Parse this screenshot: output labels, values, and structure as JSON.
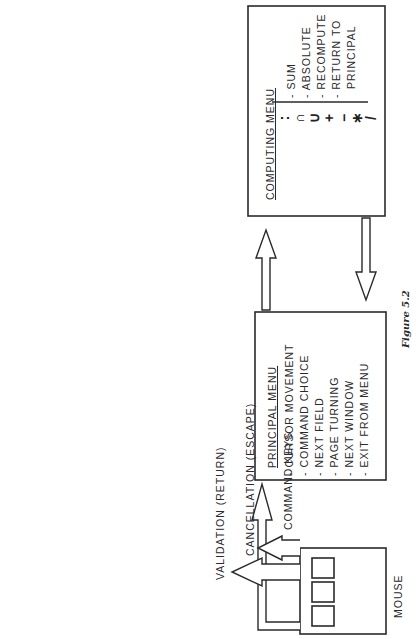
{
  "figure": {
    "caption": "Figure 5.2"
  },
  "computing_menu": {
    "title": "COMPUTING MENU",
    "items": [
      {
        "symbol": ":",
        "label": "SUM"
      },
      {
        "symbol": "∩",
        "label": "ABSOLUTE"
      },
      {
        "symbol": "∪",
        "label": ""
      },
      {
        "symbol": "+",
        "label": ""
      },
      {
        "symbol": "−",
        "label": "RECOMPUTE"
      },
      {
        "symbol": "*",
        "label": "RETURN TO PRINCIPAL"
      },
      {
        "symbol": "/",
        "label": ""
      }
    ],
    "labels": [
      "- SUM",
      "- ABSOLUTE",
      "- RECOMPUTE",
      "- RETURN TO",
      "  PRINCIPAL"
    ],
    "symbols": [
      ":",
      "∩",
      "∪",
      "+",
      "−",
      "∗",
      "/"
    ]
  },
  "principal_menu": {
    "title": "PRINCIPAL MENU",
    "items": [
      "- CURSOR MOVEMENT",
      "- COMMAND CHOICE",
      "- NEXT FIELD",
      "- PAGE TURNING",
      "- NEXT WINDOW",
      "- EXIT FROM MENU"
    ]
  },
  "mouse": {
    "label": "MOUSE",
    "button_count": 3,
    "functions": [
      "VALIDATION (RETURN)",
      "CANCELLATION (ESCAPE)",
      "COMMAND KEYS"
    ]
  },
  "connections": [
    {
      "from": "principal_menu",
      "to": "computing_menu",
      "type": "hollow-arrow"
    },
    {
      "from": "computing_menu",
      "to": "principal_menu",
      "type": "hollow-arrow"
    },
    {
      "from": "mouse",
      "to": "principal_menu",
      "type": "hollow-arrow"
    },
    {
      "from": "mouse",
      "to": "validation",
      "type": "hollow-arrow"
    },
    {
      "from": "mouse",
      "to": "cancellation",
      "type": "hollow-arrow"
    }
  ],
  "colors": {
    "line": "#2a2a2a",
    "background": "#ffffff"
  }
}
